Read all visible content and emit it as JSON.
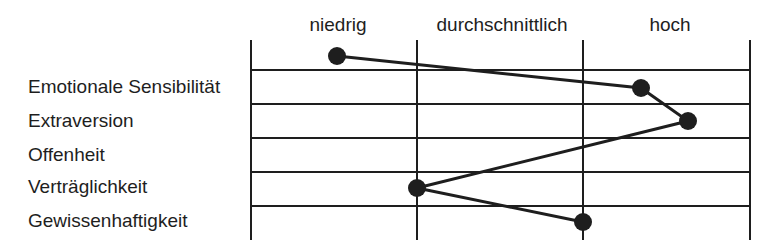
{
  "columns": [
    {
      "label": "niedrig",
      "x": 338
    },
    {
      "label": "durchschnittlich",
      "x": 502
    },
    {
      "label": "hoch",
      "x": 670
    }
  ],
  "rows": [
    {
      "label": "Emotionale Sensibilität",
      "y": 87
    },
    {
      "label": "Extraversion",
      "y": 121
    },
    {
      "label": "Offenheit",
      "y": 155
    },
    {
      "label": "Verträglichkeit",
      "y": 187
    },
    {
      "label": "Gewissenhaftigkeit",
      "y": 221
    }
  ],
  "profile_points": [
    {
      "x": 337,
      "y": 56
    },
    {
      "x": 641,
      "y": 88
    },
    {
      "x": 688,
      "y": 121
    },
    {
      "x": 417,
      "y": 188
    },
    {
      "x": 583,
      "y": 222
    }
  ],
  "grid": {
    "vertical_x": [
      251,
      417,
      583,
      750
    ],
    "horizontal_y": [
      70,
      104,
      138,
      172,
      206
    ],
    "top": 40,
    "bottom": 240,
    "color": "#1e1e1e"
  }
}
